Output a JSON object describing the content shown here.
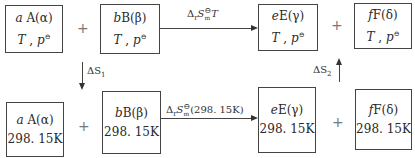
{
  "diagram": {
    "type": "thermodynamic-cycle",
    "top_row": {
      "boxes": [
        {
          "coef": "a",
          "species": "A",
          "phase": "α",
          "condition_T": "T",
          "condition_p": "p",
          "condition_sup": "⊖"
        },
        {
          "coef": "b",
          "species": "B",
          "phase": "β",
          "condition_T": "T",
          "condition_p": "p",
          "condition_sup": "⊖"
        },
        {
          "coef": "e",
          "species": "E",
          "phase": "γ",
          "condition_T": "T",
          "condition_p": "p",
          "condition_sup": "⊖"
        },
        {
          "coef": "f",
          "species": "F",
          "phase": "δ",
          "condition_T": "T",
          "condition_p": "p",
          "condition_sup": "⊖"
        }
      ],
      "plus_left": "+",
      "plus_right": "+",
      "arrow_label": {
        "delta": "Δ",
        "sub_r": "r",
        "S": "S",
        "sup": "⊖",
        "sub_m": "m",
        "arg": "T"
      }
    },
    "bottom_row": {
      "boxes": [
        {
          "coef": "a",
          "species": "A",
          "phase": "α",
          "condition": "298. 15K"
        },
        {
          "coef": "b",
          "species": "B",
          "phase": "β",
          "condition": "298. 15K"
        },
        {
          "coef": "e",
          "species": "E",
          "phase": "γ",
          "condition": "298. 15K"
        },
        {
          "coef": "f",
          "species": "F",
          "phase": "δ",
          "condition": "298. 15K"
        }
      ],
      "plus_left": "+",
      "plus_right": "+",
      "arrow_label": {
        "delta": "Δ",
        "sub_r": "r",
        "S": "S",
        "sup": "⊖",
        "sub_m": "m",
        "arg": "(298. 15K)"
      }
    },
    "vertical_arrows": [
      {
        "label": "ΔS",
        "sub": "1",
        "direction": "down"
      },
      {
        "label": "ΔS",
        "sub": "2",
        "direction": "up"
      }
    ]
  }
}
